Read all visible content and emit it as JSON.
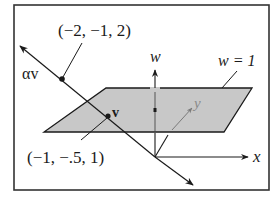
{
  "diagram": {
    "labels": {
      "point_upper": "(−2, −1, 2)",
      "point_lower": "(−1, −.5, 1)",
      "alpha_v": "αv",
      "v": "v",
      "w_axis": "w",
      "x_axis": "x",
      "y_axis": "y",
      "plane": "w = 1"
    },
    "colors": {
      "stroke": "#1a1a1a",
      "plane_fill": "#c8c8c8",
      "hidden_axis": "#7a7a7a",
      "background": "#ffffff"
    }
  }
}
